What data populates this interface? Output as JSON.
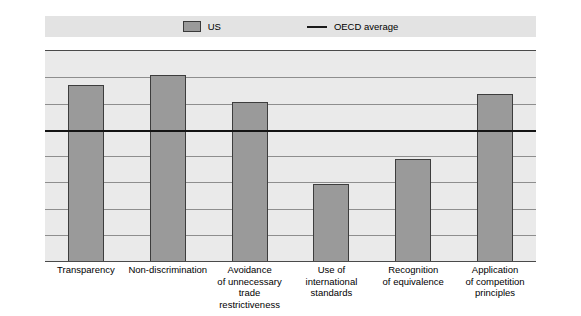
{
  "chart_data": {
    "type": "bar",
    "title": "",
    "subtitle": "",
    "xlabel": "",
    "ylabel": "",
    "ylim": [
      0,
      160
    ],
    "yticks": [
      0,
      20,
      40,
      60,
      80,
      100,
      120,
      140,
      160
    ],
    "grid": true,
    "dual_y_axis": true,
    "legend_position": "top",
    "categories": [
      "Transparency",
      "Non-discrimination",
      "Avoidance\nof unnecessary\ntrade restrictiveness",
      "Use of international\nstandards",
      "Recognition\nof equivalence",
      "Application\nof competition\nprinciples"
    ],
    "category_lines": [
      [
        "Transparency"
      ],
      [
        "Non-discrimination"
      ],
      [
        "Avoidance",
        "of unnecessary",
        "trade restrictiveness"
      ],
      [
        "Use of international",
        "standards"
      ],
      [
        "Recognition",
        "of equivalence"
      ],
      [
        "Application",
        "of competition",
        "principles"
      ]
    ],
    "series": [
      {
        "name": "US",
        "type": "bar",
        "color": "#9a9a9a",
        "edge_color": "#3d3d3d",
        "values": [
          134,
          142,
          121,
          59,
          78,
          127
        ]
      },
      {
        "name": "OECD average",
        "type": "line",
        "color": "#141414",
        "value": 100
      }
    ],
    "legend": [
      {
        "label": "US",
        "marker": "bar-swatch",
        "color": "#9a9a9a"
      },
      {
        "label": "OECD average",
        "marker": "line-swatch",
        "color": "#141414"
      }
    ],
    "colors": {
      "plot_background": "#eaeaea",
      "legend_background": "#e3e3e3",
      "gridline": "#8e8e8e",
      "axis": "#4a4a4a",
      "bar_fill": "#9a9a9a",
      "bar_edge": "#3d3d3d",
      "average_line": "#141414",
      "text": "#000000",
      "page_background": "#ffffff"
    }
  }
}
